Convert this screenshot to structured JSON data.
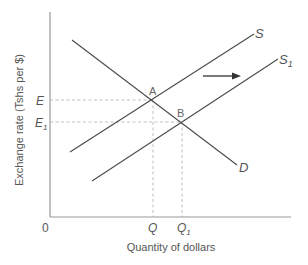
{
  "diagram": {
    "type": "supply-demand",
    "y_axis_label": "Exchange rate (Tshs per $)",
    "x_axis_label": "Quantity of dollars",
    "origin_label": "0",
    "y_ticks": [
      {
        "label": "E",
        "sub": ""
      },
      {
        "label": "E",
        "sub": "1"
      }
    ],
    "x_ticks": [
      {
        "label": "Q",
        "sub": ""
      },
      {
        "label": "Q",
        "sub": "1"
      }
    ],
    "curves": [
      {
        "name": "S",
        "sub": "",
        "kind": "supply"
      },
      {
        "name": "S",
        "sub": "1",
        "kind": "supply-shifted"
      },
      {
        "name": "D",
        "sub": "",
        "kind": "demand"
      }
    ],
    "points": [
      {
        "label": "A",
        "meaning": "intersection of S and D at (Q, E)"
      },
      {
        "label": "B",
        "meaning": "intersection of S1 and D at (Q1, E1)"
      }
    ],
    "shift_arrow": {
      "direction": "right",
      "meaning": "supply shifts from S to S1"
    },
    "colors": {
      "axis": "#9a9a9a",
      "curve": "#4a4a4a",
      "guide": "#b8b8b8",
      "text": "#555555",
      "background": "#ffffff"
    }
  }
}
